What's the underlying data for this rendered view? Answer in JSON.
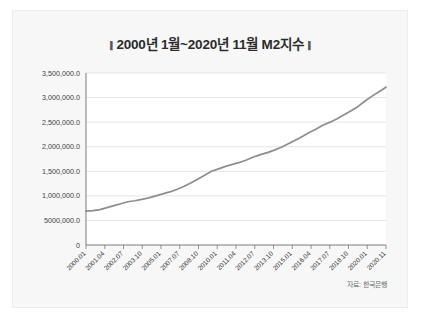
{
  "card": {
    "title": "2000년 1월~2020년 11월 M2지수",
    "title_bar_glyph": "▮",
    "source_note": "자료: 한국은행"
  },
  "colors": {
    "line": "#8d8d8d",
    "grid": "#d9d9d9",
    "axis": "#7a7a7a",
    "plot_bg": "#ffffff",
    "card_bg": "#f7f7f7",
    "text": "#3d3d3d"
  },
  "chart_data": {
    "type": "line",
    "title": "2000년 1월~2020년 11월 M2지수",
    "xlabel": "",
    "ylabel": "",
    "ylim": [
      0,
      3500000
    ],
    "grid": true,
    "legend": "none",
    "ytick_labels": [
      "3,500,000.0",
      "3,000,000.0",
      "2,500,000.0",
      "2,000,000.0",
      "1,500,000.0",
      "1,000,000.0",
      "5000,000.0",
      "0"
    ],
    "ytick_values": [
      3500000,
      3000000,
      2500000,
      2000000,
      1500000,
      1000000,
      500000,
      0
    ],
    "xtick_labels": [
      "2000.01",
      "2001.04",
      "2002.07",
      "2003.10",
      "2005.01",
      "2007.07",
      "2008.10",
      "2010.01",
      "2011.04",
      "2012.07",
      "2013.10",
      "2015.01",
      "2016.04",
      "2017.07",
      "2018.10",
      "2020.01",
      "2020.11"
    ],
    "x": [
      "2000.01",
      "2000.07",
      "2001.01",
      "2001.07",
      "2002.01",
      "2002.07",
      "2003.01",
      "2003.07",
      "2004.01",
      "2004.07",
      "2005.01",
      "2005.07",
      "2006.01",
      "2006.07",
      "2007.01",
      "2007.07",
      "2008.01",
      "2008.07",
      "2009.01",
      "2009.07",
      "2010.01",
      "2010.07",
      "2011.01",
      "2011.07",
      "2012.01",
      "2012.07",
      "2013.01",
      "2013.07",
      "2014.01",
      "2014.07",
      "2015.01",
      "2015.07",
      "2016.01",
      "2016.07",
      "2017.01",
      "2017.07",
      "2018.01",
      "2018.07",
      "2019.01",
      "2019.07",
      "2020.01",
      "2020.05",
      "2020.08",
      "2020.11"
    ],
    "values": [
      690000,
      700000,
      720000,
      760000,
      800000,
      840000,
      880000,
      900000,
      930000,
      960000,
      1000000,
      1040000,
      1080000,
      1130000,
      1190000,
      1260000,
      1340000,
      1420000,
      1500000,
      1550000,
      1600000,
      1640000,
      1680000,
      1730000,
      1790000,
      1840000,
      1880000,
      1930000,
      1990000,
      2060000,
      2130000,
      2210000,
      2290000,
      2360000,
      2440000,
      2500000,
      2570000,
      2650000,
      2730000,
      2820000,
      2930000,
      3030000,
      3120000,
      3210000
    ]
  }
}
